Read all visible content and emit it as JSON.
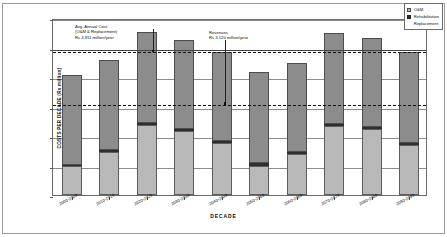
{
  "chart_data": {
    "type": "bar",
    "subtype": "stacked-column",
    "title": "",
    "xlabel": "DECADE",
    "ylabel": "COSTS PER DECADE (Rs million)",
    "ylim": [
      0,
      60000
    ],
    "yticks": [
      0,
      10000,
      20000,
      30000,
      40000,
      50000,
      60000
    ],
    "ytick_labels": [
      "0",
      "10,000",
      "20,000",
      "30,000",
      "40,000",
      "50,000",
      "60,000"
    ],
    "grid": true,
    "legend_position": "top-right",
    "categories": [
      "2000-2009",
      "2010-2019",
      "2020-2029",
      "2030-2039",
      "2040-2049",
      "2050-2059",
      "2060-2069",
      "2070-2079",
      "2080-2089",
      "2090-2099"
    ],
    "series": [
      {
        "name": "O&M",
        "values": [
          9700,
          14500,
          23800,
          21700,
          17600,
          10000,
          13900,
          23500,
          22300,
          16800
        ]
      },
      {
        "name": "Rehabilitation",
        "values": [
          600,
          700,
          700,
          700,
          700,
          700,
          700,
          700,
          700,
          700
        ]
      },
      {
        "name": "Replacement",
        "values": [
          30500,
          30600,
          30900,
          30300,
          30300,
          30900,
          30100,
          30600,
          30100,
          30900
        ]
      }
    ],
    "totals": [
      40800,
      45800,
      55400,
      52700,
      48600,
      41600,
      44700,
      54800,
      53100,
      48400
    ],
    "reference_lines": [
      {
        "name": "avg-annual-cost",
        "value": 49110,
        "style": "dashed",
        "label_lines": [
          "Avg. Annual Cost",
          "(O&M & Replacement)",
          "Rs 4,911 million/year"
        ]
      },
      {
        "name": "revenues",
        "value": 31200,
        "style": "dashed",
        "label_lines": [
          "Revenues",
          "Rs 3,120 million/year"
        ]
      }
    ],
    "colors": {
      "om": "#b9b9b9",
      "rehabilitation": "#2e2e2e",
      "replacement": "#8c8c8c",
      "gridline": "#8d8d8d",
      "refline": "#111111"
    }
  },
  "legend": {
    "items": [
      {
        "label": "O&M",
        "swatch": "om"
      },
      {
        "label": "Rehabilitation",
        "swatch": "rehabilitation"
      },
      {
        "label": "Replacement",
        "swatch": "replacement"
      }
    ]
  },
  "annotations": {
    "avg_cost": {
      "line1": "Avg. Annual Cost",
      "line2": "(O&M & Replacement)",
      "line3": "Rs 4,911 million/year"
    },
    "revenues": {
      "line1": "Revenues",
      "line2": "Rs 3,120 million/year"
    }
  }
}
